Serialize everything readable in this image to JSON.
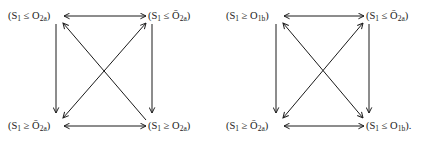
{
  "diagrams": [
    {
      "nodes": {
        "tl": {
          "open": "(S",
          "s1": "1",
          "rel": " ≤ ",
          "var": "O",
          "varbar": "",
          "sub": "2a",
          "close": ")"
        },
        "tr": {
          "open": "(S",
          "s1": "1",
          "rel": " ≤ ",
          "var": "",
          "varbar": "Ō",
          "sub": "2a",
          "close": ")"
        },
        "bl": {
          "open": "(S",
          "s1": "1",
          "rel": " ≥ ",
          "var": "",
          "varbar": "Ō",
          "sub": "2a",
          "close": ")"
        },
        "br": {
          "open": "(S",
          "s1": "1",
          "rel": " ≥ ",
          "var": "O",
          "varbar": "",
          "sub": "2a",
          "close": ")"
        }
      },
      "edges": [
        {
          "from": "tl",
          "to": "tr",
          "type": "bidirectional"
        },
        {
          "from": "bl",
          "to": "br",
          "type": "bidirectional"
        },
        {
          "from": "tl",
          "to": "bl",
          "type": "directed"
        },
        {
          "from": "tr",
          "to": "br",
          "type": "directed"
        },
        {
          "from": "br",
          "to": "tl",
          "type": "directed"
        },
        {
          "from": "tr",
          "to": "bl",
          "type": "bidirectional"
        }
      ]
    },
    {
      "nodes": {
        "tl": {
          "open": "(S",
          "s1": "1",
          "rel": " ≥ ",
          "var": "O",
          "varbar": "",
          "sub": "1b",
          "close": ")"
        },
        "tr": {
          "open": "(S",
          "s1": "1",
          "rel": " ≤ ",
          "var": "",
          "varbar": "Ō",
          "sub": "2a",
          "close": ")"
        },
        "bl": {
          "open": "(S",
          "s1": "1",
          "rel": " ≥ ",
          "var": "",
          "varbar": "Ō",
          "sub": "2a",
          "close": ")"
        },
        "br": {
          "open": "(S",
          "s1": "1",
          "rel": " ≤ ",
          "var": "O",
          "varbar": "",
          "sub": "1b",
          "close": ")."
        }
      },
      "edges": [
        {
          "from": "tl",
          "to": "tr",
          "type": "bidirectional"
        },
        {
          "from": "bl",
          "to": "br",
          "type": "bidirectional"
        },
        {
          "from": "tl",
          "to": "bl",
          "type": "directed"
        },
        {
          "from": "tr",
          "to": "br",
          "type": "directed"
        },
        {
          "from": "tl",
          "to": "br",
          "type": "bidirectional"
        },
        {
          "from": "tr",
          "to": "bl",
          "type": "bidirectional"
        }
      ]
    }
  ]
}
